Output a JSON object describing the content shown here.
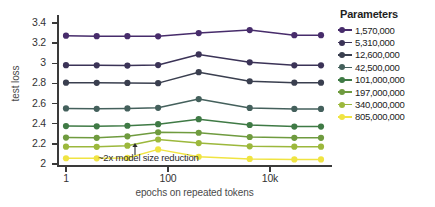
{
  "chart_data": {
    "type": "line",
    "title": "",
    "xlabel": "epochs on repeated tokens",
    "ylabel": "test loss",
    "xscale": "log",
    "x": [
      1,
      4,
      16,
      64,
      400,
      4000,
      30000,
      100000
    ],
    "xtick_labels": [
      "1",
      "100",
      "10k"
    ],
    "xtick_values": [
      1,
      100,
      10000
    ],
    "ytick_labels": [
      "2",
      "2.2",
      "2.4",
      "2.6",
      "2.8",
      "3",
      "3.2",
      "3.4"
    ],
    "ytick_values": [
      2,
      2.2,
      2.4,
      2.6,
      2.8,
      3,
      3.2,
      3.4
    ],
    "ylim": [
      1.97,
      3.48
    ],
    "grid": false,
    "legend_position": "right",
    "legend_title": "Parameters",
    "annotations": [
      {
        "text": "~2x model size reduction",
        "arrow": "up",
        "x": 64,
        "y": 2.145
      }
    ],
    "series": [
      {
        "name": "1,570,000",
        "color": "#472c6b",
        "values": [
          3.275,
          3.27,
          3.27,
          3.268,
          3.3,
          3.33,
          3.28,
          3.28
        ]
      },
      {
        "name": "5,310,000",
        "color": "#3b3357",
        "values": [
          2.982,
          2.98,
          2.978,
          2.983,
          3.088,
          3.01,
          2.98,
          2.98
        ]
      },
      {
        "name": "12,600,000",
        "color": "#3a3f4f",
        "values": [
          2.808,
          2.806,
          2.805,
          2.803,
          2.912,
          2.822,
          2.808,
          2.808
        ]
      },
      {
        "name": "42,500,000",
        "color": "#44605c",
        "values": [
          2.552,
          2.548,
          2.552,
          2.558,
          2.645,
          2.557,
          2.547,
          2.547
        ]
      },
      {
        "name": "101,000,000",
        "color": "#3f7a45",
        "values": [
          2.377,
          2.374,
          2.38,
          2.395,
          2.445,
          2.387,
          2.372,
          2.372
        ]
      },
      {
        "name": "197,000,000",
        "color": "#6f9b3f",
        "values": [
          2.262,
          2.26,
          2.275,
          2.315,
          2.31,
          2.268,
          2.26,
          2.26
        ]
      },
      {
        "name": "340,000,000",
        "color": "#9cb83c",
        "values": [
          2.172,
          2.17,
          2.182,
          2.243,
          2.208,
          2.175,
          2.172,
          2.172
        ]
      },
      {
        "name": "805,000,000",
        "color": "#f0e442",
        "values": [
          2.057,
          2.056,
          2.06,
          2.145,
          2.072,
          2.05,
          2.045,
          2.045
        ]
      }
    ]
  }
}
